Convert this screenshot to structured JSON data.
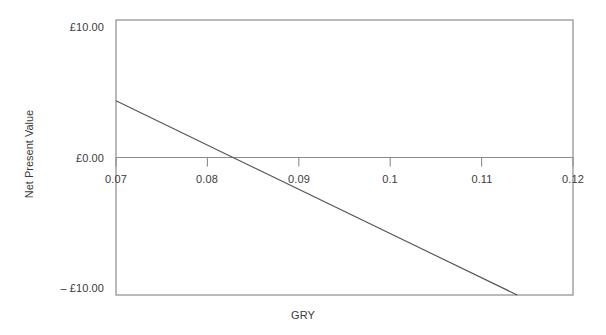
{
  "chart_data": {
    "type": "line",
    "title": "",
    "subtitle": "",
    "xlabel": "GRY",
    "ylabel": "Net Present Value",
    "xlim": [
      0.07,
      0.12
    ],
    "ylim": [
      -10.0,
      10.0
    ],
    "grid": false,
    "legend": null,
    "legend_position": "none",
    "x_ticks": [
      0.07,
      0.08,
      0.09,
      0.1,
      0.11,
      0.12
    ],
    "x_tick_labels": [
      "0.07",
      "0.08",
      "0.09",
      "0.1",
      "0.11",
      "0.12"
    ],
    "y_ticks": [
      10.0,
      0.0,
      -10.0
    ],
    "y_tick_labels": [
      "£10.00",
      "£0.00",
      "– £10.00"
    ],
    "zero_line": true,
    "x": [
      0.07,
      0.0828,
      0.1139
    ],
    "y": [
      4.13,
      0.0,
      -10.0
    ],
    "series": [
      {
        "name": "Net Present Value",
        "x": [
          0.07,
          0.0828,
          0.1139
        ],
        "values": [
          4.13,
          0.0,
          -10.0
        ],
        "color": "#555555"
      }
    ],
    "annotations": [],
    "irr_crossing": 0.0828
  },
  "axes": {
    "y_title": "Net Present Value",
    "x_title": "GRY",
    "y_labels": {
      "top": "£10.00",
      "zero": "£0.00",
      "bottom": "– £10.00"
    },
    "x_labels": [
      "0.07",
      "0.08",
      "0.09",
      "0.1",
      "0.11",
      "0.12"
    ]
  },
  "style": {
    "background": "#ffffff",
    "frame_color": "#8c8c8c",
    "zero_line_color": "#8c8c8c",
    "tick_color": "#8c8c8c",
    "data_line_color": "#555555",
    "text_color": "#3a3a3a"
  }
}
